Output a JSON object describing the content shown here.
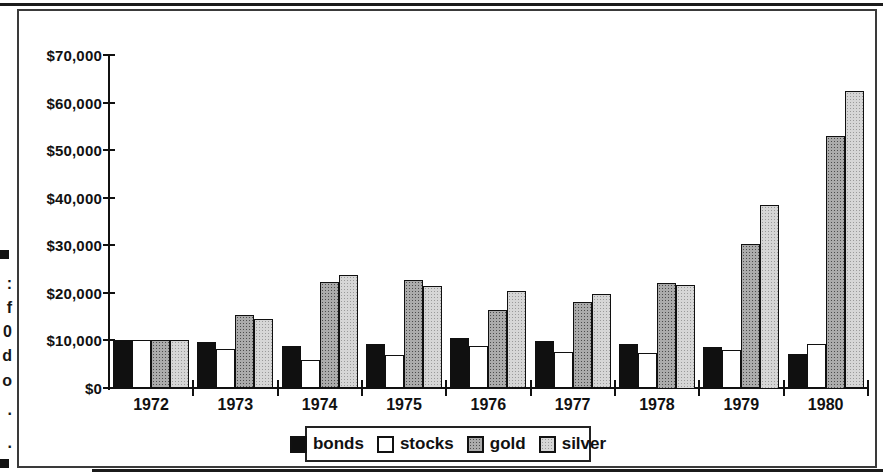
{
  "figure": {
    "caption_margin_fragments": [
      {
        "kind": "square",
        "y": 250
      },
      {
        "kind": "text",
        "text": ":",
        "y": 276
      },
      {
        "kind": "text",
        "text": "f",
        "y": 300
      },
      {
        "kind": "text",
        "text": "0",
        "y": 324
      },
      {
        "kind": "text",
        "text": "d",
        "y": 348
      },
      {
        "kind": "text",
        "text": "o",
        "y": 373
      },
      {
        "kind": "text",
        "text": ".",
        "y": 402
      },
      {
        "kind": "text",
        "text": ".",
        "y": 435
      },
      {
        "kind": "square",
        "y": 459
      }
    ]
  },
  "chart_data": {
    "type": "bar",
    "categories": [
      "1972",
      "1973",
      "1974",
      "1975",
      "1976",
      "1977",
      "1978",
      "1979",
      "1980"
    ],
    "series": [
      {
        "name": "bonds",
        "values": [
          9900,
          9600,
          8700,
          9100,
          10400,
          9700,
          9100,
          8500,
          7100
        ]
      },
      {
        "name": "stocks",
        "values": [
          9900,
          8100,
          5700,
          6800,
          8700,
          7400,
          7300,
          7800,
          9100
        ]
      },
      {
        "name": "gold",
        "values": [
          9900,
          15300,
          22200,
          22600,
          16300,
          18100,
          22000,
          30200,
          53000
        ]
      },
      {
        "name": "silver",
        "values": [
          9900,
          14400,
          23600,
          21300,
          20300,
          19700,
          21500,
          38500,
          62400
        ]
      }
    ],
    "ylim": [
      0,
      70000
    ],
    "ytick_step": 10000,
    "ytick_labels": [
      "$0",
      "$10,000",
      "$20,000",
      "$30,000",
      "$40,000",
      "$50,000",
      "$60,000",
      "$70,000"
    ],
    "xlabel": "",
    "ylabel": "",
    "grid": false,
    "legend_position": "bottom-center"
  },
  "colors": {
    "bonds": "#101010",
    "stocks": "#ffffff",
    "gold": "#ababab",
    "silver": "#d6d6d6",
    "axis": "#111111",
    "frame": "#3a3a3a"
  }
}
